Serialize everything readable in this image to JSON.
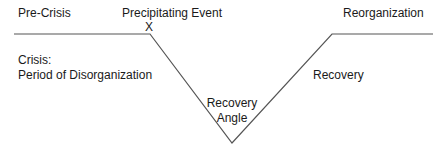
{
  "diagram": {
    "type": "crisis-recovery-curve",
    "labels": {
      "pre_crisis": "Pre-Crisis",
      "precipitating_event": "Precipitating Event",
      "event_marker": "X",
      "reorganization": "Reorganization",
      "crisis_title": "Crisis:",
      "crisis_subtitle": "Period of Disorganization",
      "recovery_angle_line1": "Recovery",
      "recovery_angle_line2": "Angle",
      "recovery": "Recovery"
    },
    "line_color": "#555555",
    "path_points": [
      [
        14,
        34
      ],
      [
        150,
        34
      ],
      [
        232,
        143
      ],
      [
        332,
        34
      ],
      [
        433,
        34
      ]
    ]
  }
}
